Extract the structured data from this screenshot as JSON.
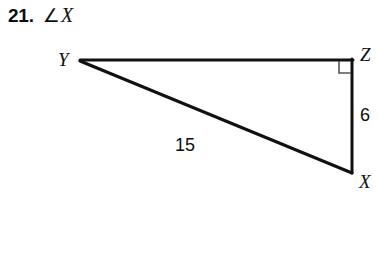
{
  "problem": {
    "number": "21.",
    "angle_symbol": "∠",
    "angle_variable": "X"
  },
  "figure": {
    "type": "right-triangle",
    "vertices": [
      {
        "name": "Y",
        "label": "Y",
        "x": 80,
        "y": 60
      },
      {
        "name": "Z",
        "label": "Z",
        "x": 352,
        "y": 60
      },
      {
        "name": "X",
        "label": "X",
        "x": 352,
        "y": 172
      }
    ],
    "sides": [
      {
        "name": "YZ",
        "from": "Y",
        "to": "Z",
        "label": ""
      },
      {
        "name": "ZX",
        "from": "Z",
        "to": "X",
        "label": "6"
      },
      {
        "name": "YX",
        "from": "Y",
        "to": "X",
        "label": "15"
      }
    ],
    "right_angle_at": "Z",
    "labels": {
      "vertex_y": "Y",
      "vertex_z": "Z",
      "vertex_x": "X",
      "leg_zx": "6",
      "hypotenuse_yx": "15"
    },
    "colors": {
      "stroke": "#111111",
      "right_angle_stroke": "#555555",
      "background": "#ffffff"
    }
  }
}
